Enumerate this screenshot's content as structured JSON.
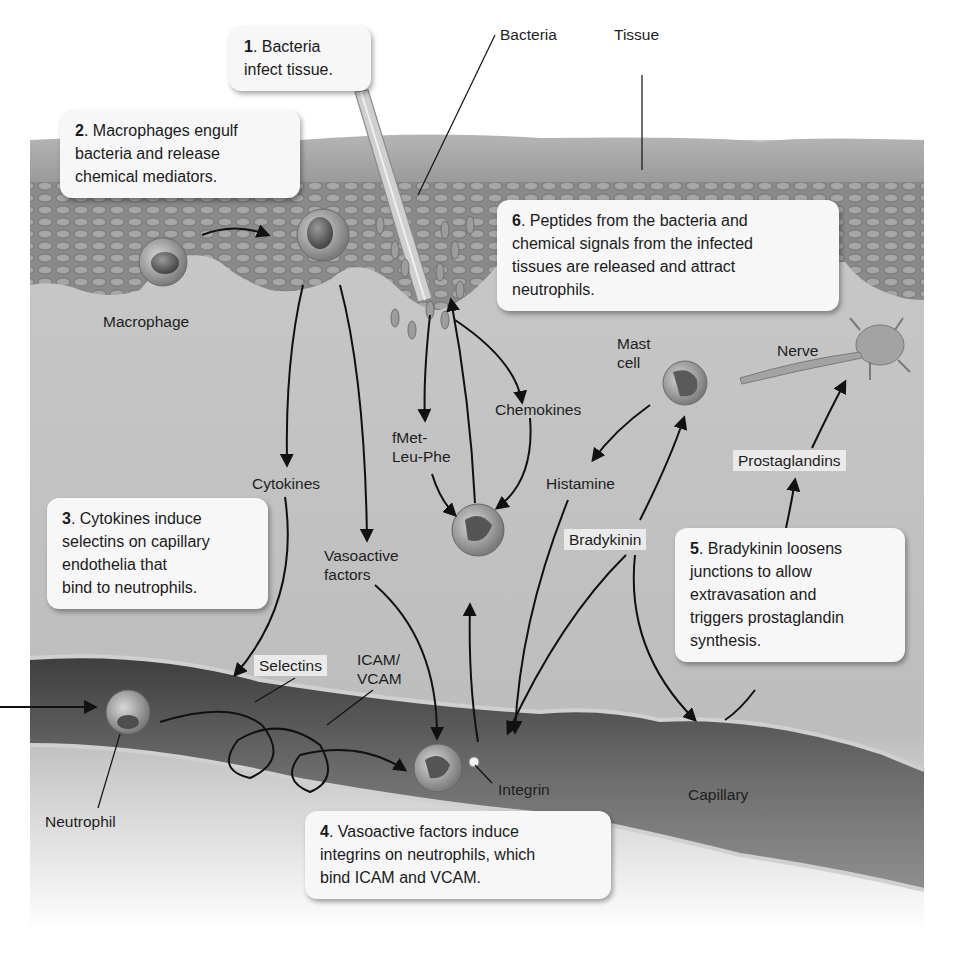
{
  "diagram": {
    "type": "biological-process-illustration",
    "palette": {
      "background": "#ffffff",
      "tissue_surface": "#a9a9a9",
      "tissue_cells": "#8a8a8a",
      "interstitium": "#c4c4c4",
      "capillary": "#5e5e5e",
      "arrow": "#111111",
      "callout_bg": "#f7f7f7"
    },
    "steps": [
      {
        "number": "1",
        "text": ". Bacteria infect tissue.",
        "line1": ". Bacteria",
        "line2": "infect tissue."
      },
      {
        "number": "2",
        "line1": ". Macrophages engulf",
        "line2": "bacteria and release",
        "line3": "chemical mediators."
      },
      {
        "number": "3",
        "line1": ". Cytokines induce",
        "line2": "selectins on capillary",
        "line3": "endothelia that",
        "line4": "bind to neutrophils."
      },
      {
        "number": "4",
        "line1": ". Vasoactive factors induce",
        "line2": "integrins on neutrophils, which",
        "line3": "bind ICAM and VCAM."
      },
      {
        "number": "5",
        "line1": ". Bradykinin loosens",
        "line2": "junctions to allow",
        "line3": "extravasation and",
        "line4": "triggers prostaglandin",
        "line5": "synthesis."
      },
      {
        "number": "6",
        "line1": ". Peptides from the bacteria and",
        "line2": "chemical signals from the infected",
        "line3": "tissues are released and attract",
        "line4": "neutrophils."
      }
    ],
    "labels": {
      "bacteria": "Bacteria",
      "tissue": "Tissue",
      "macrophage": "Macrophage",
      "mast_cell_1": "Mast",
      "mast_cell_2": "cell",
      "nerve": "Nerve",
      "chemokines": "Chemokines",
      "fmet_1": "fMet-",
      "fmet_2": "Leu-Phe",
      "cytokines": "Cytokines",
      "histamine": "Histamine",
      "prostaglandins": "Prostaglandins",
      "vasoactive_1": "Vasoactive",
      "vasoactive_2": "factors",
      "bradykinin": "Bradykinin",
      "selectins": "Selectins",
      "icam_1": "ICAM/",
      "icam_2": "VCAM",
      "neutrophil": "Neutrophil",
      "integrin": "Integrin",
      "capillary": "Capillary"
    },
    "icons": {
      "macrophage": "macrophage-cell-icon",
      "mast_cell": "mast-cell-icon",
      "nerve": "nerve-cell-icon",
      "neutrophil": "neutrophil-cell-icon",
      "bacteria": "bacteria-rod-icon"
    }
  }
}
